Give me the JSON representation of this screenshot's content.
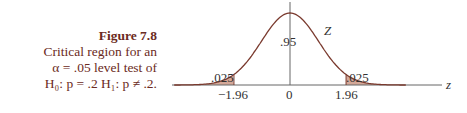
{
  "caption": {
    "figure": "Figure 7.8",
    "line1": "Critical region for an",
    "line2": "α = .05 level test of",
    "line3": "H₀: p = .2   H₁: p ≠ .2."
  },
  "chart_data": {
    "type": "area",
    "xlabel": "z",
    "curve_label": "Z",
    "x_ticks": [
      "−1.96",
      "0",
      "1.96"
    ],
    "regions": [
      {
        "name": "left tail",
        "range": [
          -3.2,
          -1.96
        ],
        "area": ".025"
      },
      {
        "name": "center",
        "range": [
          -1.96,
          1.96
        ],
        "area": ".95"
      },
      {
        "name": "right tail",
        "range": [
          1.96,
          3.2
        ],
        "area": ".025"
      }
    ],
    "colors": {
      "tail_fill": "#d4a898",
      "curve": "#7a3a2e",
      "axis": "#666666"
    }
  }
}
